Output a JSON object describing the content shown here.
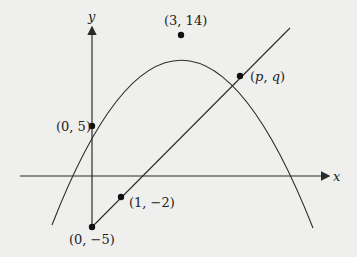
{
  "axes": {
    "x_label": "x",
    "y_label": "y"
  },
  "points": [
    {
      "id": "vertex",
      "label": "(3, 14)",
      "x": 3,
      "y": 14
    },
    {
      "id": "y-intercept-parabola",
      "label": "(0, 5)",
      "x": 0,
      "y": 5
    },
    {
      "id": "y-intercept-line",
      "label": "(0, −5)",
      "x": 0,
      "y": -5
    },
    {
      "id": "line-point",
      "label": "(1, −2)",
      "x": 1,
      "y": -2
    },
    {
      "id": "intersection",
      "label_p": "p",
      "label_q": "q",
      "label": "(p, q)"
    }
  ],
  "curves": {
    "parabola": "y = -(x-3)^2 + 14",
    "line": "y = 3x - 5"
  },
  "colors": {
    "background": "#efefed",
    "stroke": "#2a2a2a"
  }
}
